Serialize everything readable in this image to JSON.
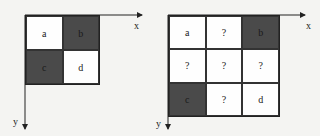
{
  "diagrams": [
    {
      "name": "left",
      "rows": 2,
      "cols": 2,
      "cells": [
        {
          "label": "a",
          "shaded": false
        },
        {
          "label": "b",
          "shaded": true
        },
        {
          "label": "c",
          "shaded": true
        },
        {
          "label": "d",
          "shaded": false
        }
      ],
      "x_axis_label": "x",
      "y_axis_label": "y"
    },
    {
      "name": "right",
      "rows": 3,
      "cols": 3,
      "cells": [
        {
          "label": "a",
          "shaded": false
        },
        {
          "label": "?",
          "shaded": false
        },
        {
          "label": "b",
          "shaded": true
        },
        {
          "label": "?",
          "shaded": false
        },
        {
          "label": "?",
          "shaded": false
        },
        {
          "label": "?",
          "shaded": false
        },
        {
          "label": "c",
          "shaded": true
        },
        {
          "label": "?",
          "shaded": false
        },
        {
          "label": "d",
          "shaded": false
        }
      ],
      "x_axis_label": "x",
      "y_axis_label": "y"
    }
  ],
  "colors": {
    "shaded": "#4a4a4a",
    "unshaded": "#fefefe",
    "line": "#222222"
  }
}
